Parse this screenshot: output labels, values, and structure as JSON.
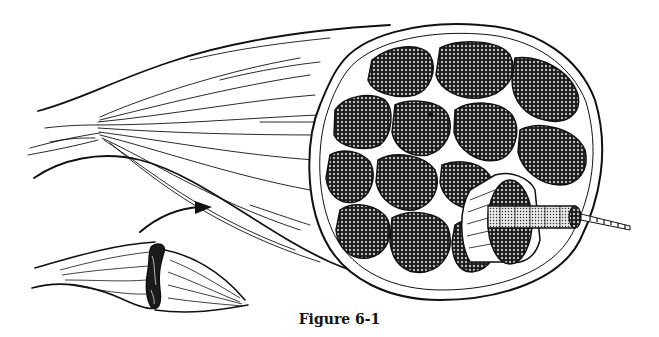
{
  "figure": {
    "caption": "Figure 6-1",
    "colors": {
      "ink": "#111111",
      "background": "#ffffff",
      "fascicle_fill": "#2a2a2a",
      "fiber_fill": "#9a9a9a"
    },
    "parts": [
      {
        "name": "muscle-belly",
        "label": ""
      },
      {
        "name": "tendon",
        "label": ""
      },
      {
        "name": "cross-section",
        "label": ""
      },
      {
        "name": "fascicle",
        "label": ""
      },
      {
        "name": "muscle-fiber",
        "label": ""
      },
      {
        "name": "myofibril",
        "label": ""
      },
      {
        "name": "inset-muscle",
        "label": ""
      },
      {
        "name": "pointer-arrow",
        "label": ""
      }
    ]
  }
}
